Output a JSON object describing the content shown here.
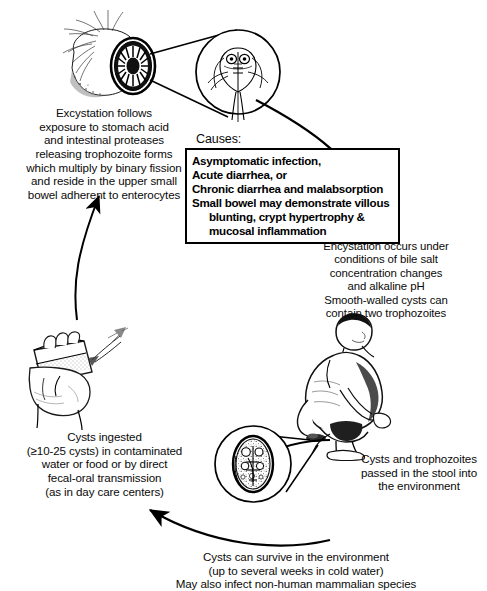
{
  "diagram": {
    "text_blocks": {
      "excystation": "Excystation follows\nexposure to stomach acid\nand intestinal proteases\nreleasing trophozoite forms\nwhich multiply by binary fission\nand reside in the upper small\nbowel adherent to enterocytes",
      "causes_label": "Causes:",
      "encystation": "Encystation occurs under\nconditions of bile salt\nconcentration changes\nand alkaline pH\nSmooth-walled cysts can\ncontain two trophozoites",
      "cysts_ingested": "Cysts ingested\n(≥10-25 cysts) in contaminated\nwater or food or by direct\nfecal-oral transmission\n(as in day care centers)",
      "passed_in_stool": "Cysts and trophozoites\npassed in the stool into\nthe environment",
      "survive_environment": "Cysts can survive in the environment\n(up to several weeks in cold water)\nMay also infect non-human mammalian species"
    },
    "causes_box": {
      "lines": [
        {
          "text": "Asymptomatic infection,",
          "indent": false
        },
        {
          "text": "Acute diarrhea, or",
          "indent": false
        },
        {
          "text": "Chronic diarrhea and malabsorption",
          "indent": false
        },
        {
          "text": "Small bowel may demonstrate villous",
          "indent": false
        },
        {
          "text": "blunting, crypt hypertrophy &",
          "indent": true
        },
        {
          "text": "mucosal inflammation",
          "indent": true
        }
      ]
    },
    "illustrations": [
      {
        "name": "intestine-cross-section",
        "label": "Small bowel cross-section with mesentery"
      },
      {
        "name": "trophozoite-magnified",
        "label": "Magnified Giardia trophozoite"
      },
      {
        "name": "hand-holding-cup",
        "label": "Hand holding cup of contaminated water"
      },
      {
        "name": "squatting-person",
        "label": "Person defecating"
      },
      {
        "name": "cyst-magnified",
        "label": "Magnified Giardia cyst"
      }
    ],
    "arrows": [
      {
        "name": "arrow-trophozoite-to-encystation",
        "from": "trophozoite-magnified",
        "to": "encystation-text"
      },
      {
        "name": "arrow-stool-to-environment",
        "from": "squatting-person",
        "to": "cysts-ingested"
      },
      {
        "name": "arrow-ingestion-to-excystation",
        "from": "hand-holding-cup",
        "to": "excystation-text"
      }
    ],
    "colors": {
      "ink": "#000000",
      "background": "#ffffff"
    }
  }
}
